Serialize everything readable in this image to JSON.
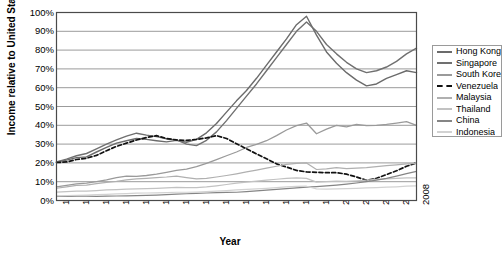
{
  "chart_data": {
    "type": "line",
    "title": "",
    "xlabel": "Year",
    "ylabel": "Income relative to United States",
    "xlim": [
      1972,
      2008
    ],
    "ylim": [
      0,
      1.0
    ],
    "grid": "horizontal",
    "legend_position": "right",
    "y_tick_labels": [
      "100%",
      "90%",
      "80%",
      "70%",
      "60%",
      "50%",
      "40%",
      "30%",
      "20%",
      "10%",
      "0%"
    ],
    "y_tick_values": [
      1.0,
      0.9,
      0.8,
      0.7,
      0.6,
      0.5,
      0.4,
      0.3,
      0.2,
      0.1,
      0.0
    ],
    "x_tick_labels": [
      "1972",
      "1974",
      "1976",
      "1978",
      "1980",
      "1982",
      "1984",
      "1986",
      "1988",
      "1990",
      "1992",
      "1994",
      "1996",
      "1998",
      "2000",
      "2002",
      "2004",
      "2006",
      "2008"
    ],
    "x_tick_values": [
      1972,
      1974,
      1976,
      1978,
      1980,
      1982,
      1984,
      1986,
      1988,
      1990,
      1992,
      1994,
      1996,
      1998,
      2000,
      2002,
      2004,
      2006,
      2008
    ],
    "x": [
      1972,
      1973,
      1974,
      1975,
      1976,
      1977,
      1978,
      1979,
      1980,
      1981,
      1982,
      1983,
      1984,
      1985,
      1986,
      1987,
      1988,
      1989,
      1990,
      1991,
      1992,
      1993,
      1994,
      1995,
      1996,
      1997,
      1998,
      1999,
      2000,
      2001,
      2002,
      2003,
      2004,
      2005,
      2006,
      2007,
      2008
    ],
    "series": [
      {
        "name": "Hong Kong",
        "color": "#6b6b6b",
        "dash": false,
        "width": 1.4,
        "values": [
          0.205,
          0.215,
          0.228,
          0.232,
          0.258,
          0.282,
          0.305,
          0.318,
          0.33,
          0.325,
          0.318,
          0.312,
          0.32,
          0.31,
          0.325,
          0.36,
          0.41,
          0.47,
          0.53,
          0.585,
          0.65,
          0.72,
          0.79,
          0.86,
          0.935,
          0.98,
          0.88,
          0.79,
          0.73,
          0.68,
          0.64,
          0.61,
          0.62,
          0.65,
          0.67,
          0.69,
          0.68
        ]
      },
      {
        "name": "Singapore",
        "color": "#707070",
        "dash": false,
        "width": 1.4,
        "values": [
          0.205,
          0.22,
          0.238,
          0.25,
          0.275,
          0.3,
          0.322,
          0.342,
          0.358,
          0.348,
          0.34,
          0.328,
          0.322,
          0.3,
          0.292,
          0.32,
          0.365,
          0.425,
          0.49,
          0.555,
          0.62,
          0.69,
          0.76,
          0.83,
          0.9,
          0.95,
          0.9,
          0.83,
          0.78,
          0.735,
          0.7,
          0.68,
          0.69,
          0.71,
          0.74,
          0.78,
          0.81
        ]
      },
      {
        "name": "South Korea",
        "color": "#9a9a9a",
        "dash": false,
        "width": 1.3,
        "values": [
          0.072,
          0.08,
          0.088,
          0.092,
          0.1,
          0.11,
          0.122,
          0.13,
          0.128,
          0.133,
          0.14,
          0.15,
          0.16,
          0.167,
          0.18,
          0.198,
          0.218,
          0.238,
          0.258,
          0.282,
          0.298,
          0.318,
          0.345,
          0.375,
          0.398,
          0.412,
          0.355,
          0.38,
          0.4,
          0.392,
          0.405,
          0.398,
          0.4,
          0.405,
          0.412,
          0.42,
          0.4
        ]
      },
      {
        "name": "Venezuela",
        "color": "#111111",
        "dash": true,
        "width": 1.7,
        "values": [
          0.202,
          0.205,
          0.218,
          0.225,
          0.24,
          0.265,
          0.288,
          0.305,
          0.322,
          0.335,
          0.345,
          0.33,
          0.322,
          0.32,
          0.325,
          0.333,
          0.345,
          0.33,
          0.302,
          0.275,
          0.248,
          0.222,
          0.195,
          0.178,
          0.16,
          0.152,
          0.15,
          0.148,
          0.148,
          0.14,
          0.125,
          0.108,
          0.118,
          0.138,
          0.158,
          0.182,
          0.2
        ]
      },
      {
        "name": "Malaysia",
        "color": "#b0b0b0",
        "dash": false,
        "width": 1.2,
        "values": [
          0.065,
          0.072,
          0.08,
          0.082,
          0.09,
          0.096,
          0.102,
          0.11,
          0.115,
          0.118,
          0.122,
          0.125,
          0.13,
          0.122,
          0.115,
          0.118,
          0.125,
          0.133,
          0.142,
          0.152,
          0.162,
          0.172,
          0.182,
          0.192,
          0.198,
          0.2,
          0.165,
          0.168,
          0.175,
          0.17,
          0.172,
          0.175,
          0.18,
          0.185,
          0.19,
          0.195,
          0.198
        ]
      },
      {
        "name": "Thailand",
        "color": "#c2c2c2",
        "dash": false,
        "width": 1.2,
        "values": [
          0.045,
          0.047,
          0.05,
          0.05,
          0.053,
          0.056,
          0.058,
          0.06,
          0.062,
          0.063,
          0.065,
          0.067,
          0.07,
          0.068,
          0.068,
          0.072,
          0.078,
          0.085,
          0.092,
          0.098,
          0.103,
          0.108,
          0.113,
          0.118,
          0.12,
          0.118,
          0.098,
          0.1,
          0.103,
          0.102,
          0.105,
          0.108,
          0.112,
          0.115,
          0.118,
          0.12,
          0.12
        ]
      },
      {
        "name": "China",
        "color": "#858585",
        "dash": false,
        "width": 1.2,
        "values": [
          0.022,
          0.022,
          0.023,
          0.023,
          0.022,
          0.023,
          0.024,
          0.025,
          0.026,
          0.027,
          0.029,
          0.031,
          0.034,
          0.036,
          0.038,
          0.04,
          0.042,
          0.043,
          0.044,
          0.047,
          0.051,
          0.055,
          0.059,
          0.063,
          0.067,
          0.071,
          0.074,
          0.078,
          0.082,
          0.087,
          0.093,
          0.1,
          0.108,
          0.118,
          0.13,
          0.143,
          0.155
        ]
      },
      {
        "name": "Indonesia",
        "color": "#d2d2d2",
        "dash": false,
        "width": 1.2,
        "values": [
          0.025,
          0.026,
          0.028,
          0.029,
          0.031,
          0.033,
          0.035,
          0.037,
          0.039,
          0.04,
          0.041,
          0.042,
          0.044,
          0.044,
          0.045,
          0.047,
          0.05,
          0.053,
          0.056,
          0.059,
          0.062,
          0.065,
          0.068,
          0.072,
          0.075,
          0.076,
          0.062,
          0.06,
          0.062,
          0.063,
          0.065,
          0.067,
          0.069,
          0.071,
          0.073,
          0.076,
          0.078
        ]
      }
    ]
  },
  "legend": {
    "items": [
      {
        "label": "Hong Kong"
      },
      {
        "label": "Singapore"
      },
      {
        "label": "South Korea"
      },
      {
        "label": "Venezuela"
      },
      {
        "label": "Malaysia"
      },
      {
        "label": "Thailand"
      },
      {
        "label": "China"
      },
      {
        "label": "Indonesia"
      }
    ]
  }
}
